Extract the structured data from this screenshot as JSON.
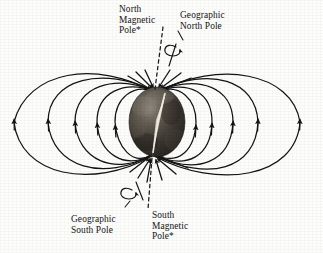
{
  "figure": {
    "background_color": "#fdfdfc",
    "line_color": "#1a1a1a",
    "sphere": {
      "name": "earth-globe",
      "center_x": 157,
      "center_y": 122,
      "radius_x": 28,
      "radius_y": 35,
      "dark_color": "#2e2b28",
      "mid_color": "#6d6760",
      "light_color": "#c9c3ba",
      "axis_highlight_color": "#efeae1"
    },
    "magnetic_axis": {
      "name": "magnetic-axis-dashed-line",
      "style": "dashed",
      "top_x": 163,
      "top_y": 27,
      "bottom_x": 148,
      "bottom_y": 213
    },
    "rotation_axis": {
      "name": "geographic-rotation-axis",
      "top_x": 172,
      "top_y": 42,
      "bottom_x": 140,
      "bottom_y": 200
    },
    "field_lines": {
      "name": "magnetic-field-lines",
      "loop_count_per_side": 5,
      "left_midline_x": [
        14,
        48,
        75,
        97,
        114
      ],
      "right_midline_x": [
        300,
        258,
        233,
        212,
        196
      ],
      "arrow_direction": "upward-outside-inward-at-north-pole",
      "north_convergence_x": 155,
      "north_convergence_y": 90,
      "south_convergence_x": 152,
      "south_convergence_y": 157
    }
  },
  "labels": {
    "north_magnetic_pole": "North\nMagnetic\nPole*",
    "geographic_north_pole": "Geographic\nNorth Pole",
    "geographic_south_pole": "Geographic\nSouth Pole",
    "south_magnetic_pole": "South\nMagnetic\nPole*"
  }
}
